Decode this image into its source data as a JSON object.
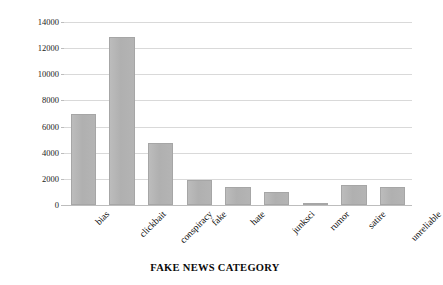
{
  "chart_data": {
    "type": "bar",
    "title": "",
    "xlabel": "FAKE NEWS CATEGORY",
    "ylabel": "NUMBER OF NEWS",
    "categories": [
      "bias",
      "clickbait",
      "conspiracy",
      "fake",
      "hate",
      "junksci",
      "rumor",
      "satire",
      "unreliable"
    ],
    "values": [
      6950,
      12850,
      4750,
      1900,
      1400,
      1000,
      150,
      1500,
      1350
    ],
    "ylim": [
      0,
      14000
    ],
    "yticks": [
      0,
      2000,
      4000,
      6000,
      8000,
      10000,
      12000,
      14000
    ],
    "ytick_labels": [
      "0",
      "2000",
      "4000",
      "6000",
      "8000",
      "10000",
      "12000",
      "14000"
    ],
    "grid": true,
    "legend": false,
    "bar_color": "#b2b2b2",
    "bar_border_color": "#a6a6a6",
    "gridline_color": "#d9d9d9",
    "axis_color": "#bdbdbd",
    "text_color": "#0a0a0a"
  }
}
